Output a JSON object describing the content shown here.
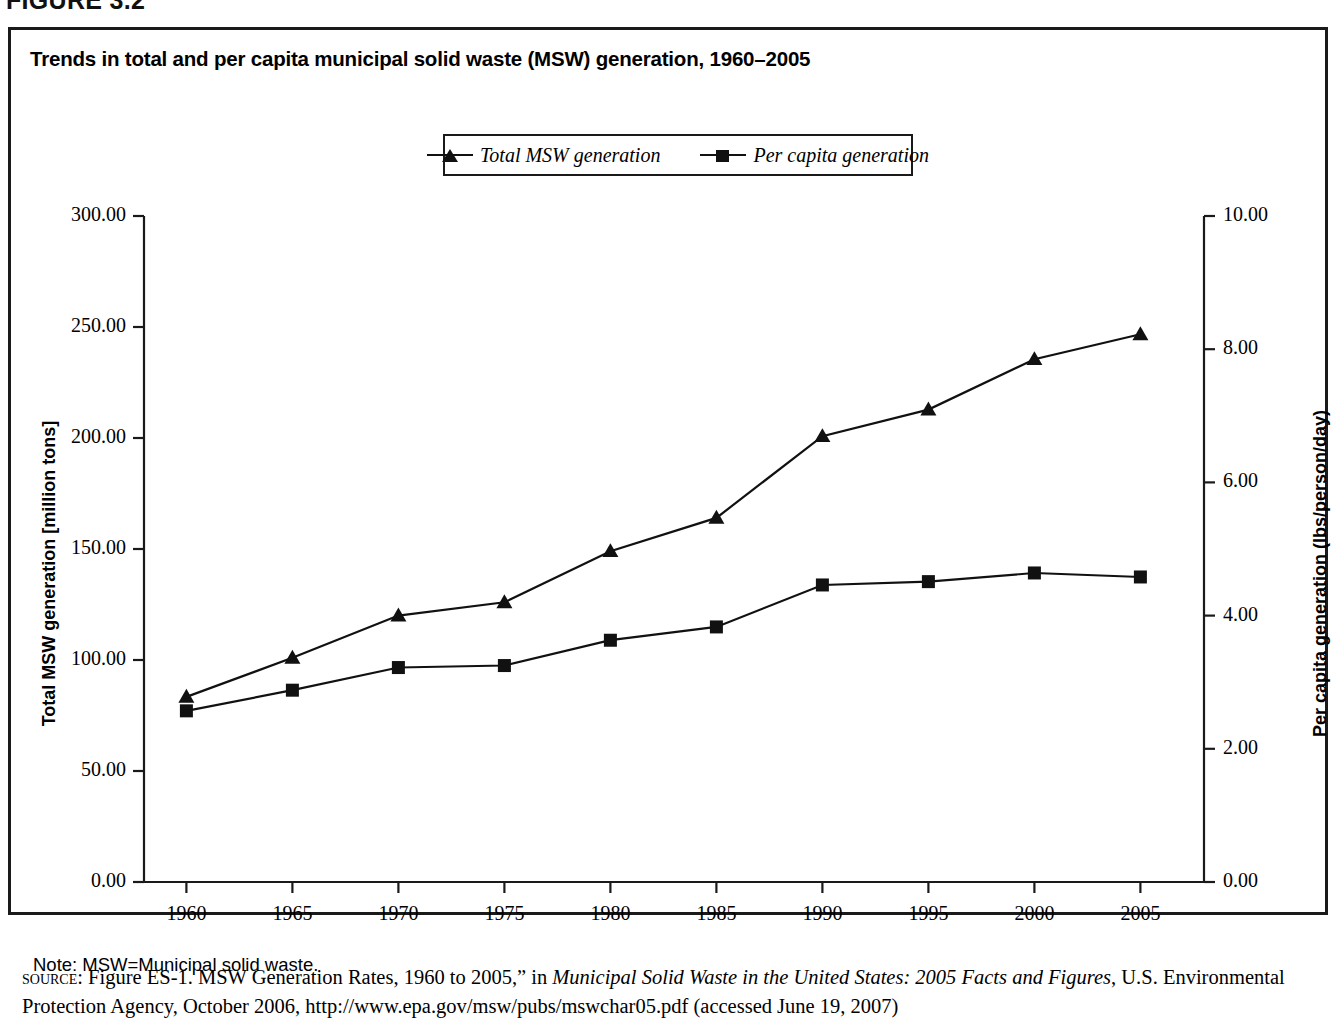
{
  "figure": {
    "number_label": "FIGURE 3.2"
  },
  "chart_title": "Trends in total and per capita municipal solid waste (MSW) generation, 1960–2005",
  "legend": {
    "position": "top-center",
    "items": [
      {
        "label": "Total MSW generation",
        "marker": "triangle-marker"
      },
      {
        "label": "Per capita generation",
        "marker": "square-marker"
      }
    ]
  },
  "axes": {
    "left": {
      "title": "Total MSW generation [million tons]",
      "ticks": [
        "0.00",
        "50.00",
        "100.00",
        "150.00",
        "200.00",
        "250.00",
        "300.00"
      ]
    },
    "right": {
      "title": "Per capita generation (lbs/person/day)",
      "ticks": [
        "0.00",
        "2.00",
        "4.00",
        "6.00",
        "8.00",
        "10.00"
      ]
    },
    "x": {
      "ticks": [
        "1960",
        "1965",
        "1970",
        "1975",
        "1980",
        "1985",
        "1990",
        "1995",
        "2000",
        "2005"
      ]
    }
  },
  "footer": {
    "note": "Note: MSW=Municipal solid waste.",
    "source_tag": "source:",
    "source_pre": " Figure ES-1. MSW Generation Rates, 1960 to 2005,” in ",
    "source_italic": "Municipal Solid Waste in the United States: 2005 Facts and Figures",
    "source_post": ", U.S. Environmental Protection Agency, October 2006, http://www.epa.gov/msw/pubs/mswchar05.pdf (accessed June 19, 2007)"
  },
  "colors": {
    "line": "#111111",
    "border": "#1a1a1a",
    "background": "#ffffff"
  },
  "chart_data": {
    "type": "line",
    "title": "Trends in total and per capita municipal solid waste (MSW) generation, 1960–2005",
    "xlabel": "",
    "ylabel": "Total MSW generation [million tons]",
    "y2label": "Per capita generation (lbs/person/day)",
    "x": [
      1960,
      1965,
      1970,
      1975,
      1980,
      1985,
      1990,
      1995,
      2000,
      2005
    ],
    "xlim": [
      1958,
      2008
    ],
    "ylim": [
      0,
      300
    ],
    "y2lim": [
      0,
      10
    ],
    "grid": false,
    "legend_position": "top-center",
    "series": [
      {
        "name": "Total MSW generation",
        "axis": "left",
        "marker": "triangle",
        "units": "million tons",
        "values": [
          83.4,
          101.0,
          120.0,
          126.0,
          149.0,
          164.0,
          200.8,
          212.8,
          235.5,
          246.7
        ]
      },
      {
        "name": "Per capita generation",
        "axis": "right",
        "marker": "square",
        "units": "lbs/person/day",
        "values": [
          2.57,
          2.88,
          3.22,
          3.25,
          3.63,
          3.83,
          4.46,
          4.51,
          4.64,
          4.58
        ]
      }
    ]
  }
}
